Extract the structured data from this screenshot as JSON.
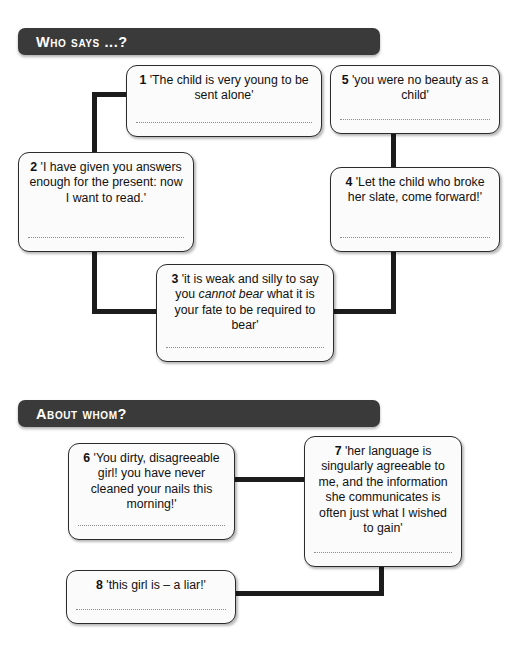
{
  "sections": [
    {
      "id": "who-says",
      "title": "Who says ...?"
    },
    {
      "id": "about-whom",
      "title": "About whom?"
    }
  ],
  "boxes": [
    {
      "number": "1",
      "quote_before": "'The child is very young to be sent alone'",
      "quote_italic": "",
      "quote_after": "",
      "answer": ""
    },
    {
      "number": "2",
      "quote_before": "'I have given you answers enough for the present: now I want to read.'",
      "quote_italic": "",
      "quote_after": "",
      "answer": ""
    },
    {
      "number": "3",
      "quote_before": "'it is weak and silly to say you ",
      "quote_italic": "cannot bear",
      "quote_after": " what it is your fate to be required to bear'",
      "answer": ""
    },
    {
      "number": "4",
      "quote_before": "'Let the child who broke her slate, come forward!'",
      "quote_italic": "",
      "quote_after": "",
      "answer": ""
    },
    {
      "number": "5",
      "quote_before": "'you were no beauty as a child'",
      "quote_italic": "",
      "quote_after": "",
      "answer": ""
    },
    {
      "number": "6",
      "quote_before": "'You dirty, disagreeable girl! you have never cleaned your nails this morning!'",
      "quote_italic": "",
      "quote_after": "",
      "answer": ""
    },
    {
      "number": "7",
      "quote_before": "'her language is singularly agreeable to me, and the information she communicates is often just what I wished to gain'",
      "quote_italic": "",
      "quote_after": "",
      "answer": ""
    },
    {
      "number": "8",
      "quote_before": "'this girl is – a liar!'",
      "quote_italic": "",
      "quote_after": "",
      "answer": ""
    }
  ],
  "colors": {
    "header_background": "#3a3a3a",
    "header_text": "#ffffff",
    "box_border": "#2b2b2b",
    "box_background": "#fbfbfb",
    "connector": "#1c1c1c",
    "answer_line": "#8e8e8e",
    "page_background": "#ffffff"
  }
}
